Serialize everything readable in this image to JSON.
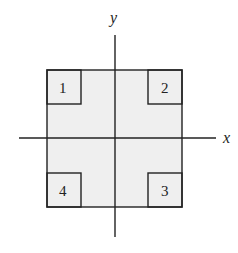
{
  "diagram": {
    "axes": {
      "x_label": "x",
      "y_label": "y"
    },
    "regions": [
      {
        "label": "1",
        "position": "top-left"
      },
      {
        "label": "2",
        "position": "top-right"
      },
      {
        "label": "3",
        "position": "bottom-right"
      },
      {
        "label": "4",
        "position": "bottom-left"
      }
    ],
    "colors": {
      "fill": "#efefef",
      "stroke": "#222222"
    }
  }
}
